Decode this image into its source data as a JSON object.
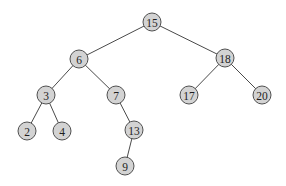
{
  "diagram": {
    "type": "binary-search-tree",
    "colors": {
      "node_fill": "#d3d3d3",
      "node_stroke": "#505050",
      "edge": "#4a4a4a",
      "text": "#1e1e1e",
      "background": "#ffffff"
    },
    "node_radius": 9,
    "nodes": [
      {
        "id": "n15",
        "label": "15",
        "x": 152,
        "y": 22
      },
      {
        "id": "n6",
        "label": "6",
        "x": 79,
        "y": 59
      },
      {
        "id": "n18",
        "label": "18",
        "x": 225,
        "y": 58
      },
      {
        "id": "n3",
        "label": "3",
        "x": 46,
        "y": 95
      },
      {
        "id": "n7",
        "label": "7",
        "x": 116,
        "y": 95
      },
      {
        "id": "n17",
        "label": "17",
        "x": 189,
        "y": 95
      },
      {
        "id": "n20",
        "label": "20",
        "x": 262,
        "y": 95
      },
      {
        "id": "n2",
        "label": "2",
        "x": 27,
        "y": 131
      },
      {
        "id": "n4",
        "label": "4",
        "x": 62,
        "y": 131
      },
      {
        "id": "n13",
        "label": "13",
        "x": 134,
        "y": 130
      },
      {
        "id": "n9",
        "label": "9",
        "x": 125,
        "y": 166
      }
    ],
    "edges": [
      {
        "from": "n15",
        "to": "n6"
      },
      {
        "from": "n15",
        "to": "n18"
      },
      {
        "from": "n6",
        "to": "n3"
      },
      {
        "from": "n6",
        "to": "n7"
      },
      {
        "from": "n18",
        "to": "n17"
      },
      {
        "from": "n18",
        "to": "n20"
      },
      {
        "from": "n3",
        "to": "n2"
      },
      {
        "from": "n3",
        "to": "n4"
      },
      {
        "from": "n7",
        "to": "n13"
      },
      {
        "from": "n13",
        "to": "n9"
      }
    ]
  }
}
